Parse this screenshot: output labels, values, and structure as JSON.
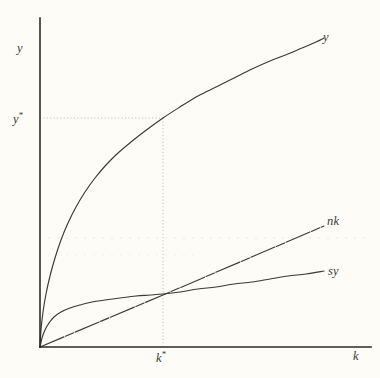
{
  "figure": {
    "name": "solow-growth-model-diagram",
    "background_color": "#fdfcf7",
    "ink_color": "#3a3a36",
    "guide_color": "#b9b4a6"
  },
  "axes": {
    "y_axis_label": "y",
    "x_axis_label": "k",
    "origin_px": [
      40,
      347
    ],
    "x_axis_end_px": [
      371,
      347
    ],
    "y_axis_top_px": [
      40,
      18
    ],
    "ticks": [],
    "grid": false
  },
  "markers": {
    "y_star_label": "y",
    "y_star_star": "*",
    "k_star_label": "k",
    "k_star_star": "*",
    "y_star_value_px": 118,
    "k_star_value_px": 163
  },
  "curves": {
    "y_label": "y",
    "nk_label": "nk",
    "sy_label": "sy"
  },
  "chart_data": {
    "type": "line",
    "title": "",
    "subtitle": "",
    "xlabel": "k",
    "ylabel": "y",
    "xlim": [
      0,
      1
    ],
    "ylim": [
      0,
      1
    ],
    "grid": false,
    "legend": "inline-at-curve-ends",
    "annotations": [
      {
        "text": "y*",
        "type": "axis-marker",
        "axis": "y",
        "value": 0.72
      },
      {
        "text": "k*",
        "type": "axis-marker",
        "axis": "x",
        "value": 0.372
      },
      {
        "text": "dotted guide lines to steady state (k*, y*)",
        "type": "guide"
      }
    ],
    "series": [
      {
        "name": "y",
        "label": "y",
        "style": "solid",
        "description": "production function y = f(k), concave increasing",
        "points_px": [
          [
            40,
            347
          ],
          [
            41,
            330
          ],
          [
            43,
            312
          ],
          [
            46,
            294
          ],
          [
            50,
            276
          ],
          [
            55,
            258
          ],
          [
            61,
            240
          ],
          [
            68,
            223
          ],
          [
            76,
            207
          ],
          [
            85,
            192
          ],
          [
            95,
            178
          ],
          [
            106,
            165
          ],
          [
            118,
            153
          ],
          [
            131,
            142
          ],
          [
            145,
            131
          ],
          [
            163,
            118
          ],
          [
            180,
            107
          ],
          [
            198,
            96
          ],
          [
            216,
            87
          ],
          [
            234,
            78
          ],
          [
            252,
            69
          ],
          [
            270,
            61
          ],
          [
            288,
            54
          ],
          [
            302,
            48
          ],
          [
            316,
            42
          ],
          [
            324,
            38
          ]
        ]
      },
      {
        "name": "nk",
        "label": "nk",
        "style": "dash-dot",
        "description": "break-even investment line nk, straight through origin",
        "points_px": [
          [
            40,
            347
          ],
          [
            163,
            295
          ],
          [
            324,
            226
          ]
        ]
      },
      {
        "name": "sy",
        "label": "sy",
        "style": "solid",
        "description": "actual investment sy = s*f(k), concave increasing",
        "points_px": [
          [
            40,
            347
          ],
          [
            42,
            338
          ],
          [
            45,
            330
          ],
          [
            49,
            323
          ],
          [
            54,
            317
          ],
          [
            61,
            312
          ],
          [
            70,
            308
          ],
          [
            80,
            305
          ],
          [
            92,
            302
          ],
          [
            105,
            300
          ],
          [
            120,
            298
          ],
          [
            136,
            296
          ],
          [
            150,
            295
          ],
          [
            163,
            294
          ],
          [
            180,
            292
          ],
          [
            198,
            289
          ],
          [
            216,
            287
          ],
          [
            234,
            284
          ],
          [
            252,
            282
          ],
          [
            270,
            279
          ],
          [
            288,
            276
          ],
          [
            306,
            274
          ],
          [
            324,
            271
          ]
        ]
      }
    ]
  }
}
